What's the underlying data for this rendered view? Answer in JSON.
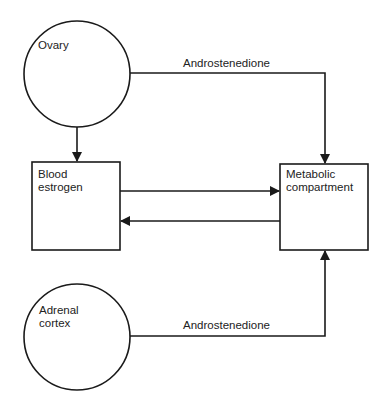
{
  "diagram": {
    "nodes": {
      "ovary": {
        "label": "Ovary",
        "shape": "circle"
      },
      "blood_estrogen": {
        "label": "Blood\nestrogen",
        "shape": "box"
      },
      "metabolic_compartment": {
        "label": "Metabolic\ncompartment",
        "shape": "box"
      },
      "adrenal_cortex": {
        "label": "Adrenal\ncortex",
        "shape": "circle"
      }
    },
    "edges": {
      "ovary_to_metabolic": {
        "label": "Androstenedione",
        "from": "ovary",
        "to": "metabolic_compartment"
      },
      "ovary_to_blood": {
        "label": "",
        "from": "ovary",
        "to": "blood_estrogen"
      },
      "blood_to_metabolic": {
        "label": "",
        "from": "blood_estrogen",
        "to": "metabolic_compartment"
      },
      "metabolic_to_blood": {
        "label": "",
        "from": "metabolic_compartment",
        "to": "blood_estrogen"
      },
      "adrenal_to_metabolic": {
        "label": "Androstenedione",
        "from": "adrenal_cortex",
        "to": "metabolic_compartment"
      }
    },
    "colors": {
      "stroke": "#1a1a1a",
      "background": "#ffffff",
      "text": "#222222"
    }
  }
}
